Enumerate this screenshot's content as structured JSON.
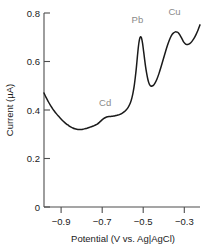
{
  "chart_data": {
    "type": "line",
    "title": "",
    "subtitle": "",
    "xlabel": "Potential (V vs. Ag|AgCl)",
    "ylabel": "Current (µA)",
    "xlim": [
      -0.97,
      -0.21
    ],
    "ylim": [
      0,
      0.8
    ],
    "grid": false,
    "legend": "none",
    "xticks": [
      -0.9,
      -0.7,
      -0.5,
      -0.3
    ],
    "xtick_labels": [
      "−0.9",
      "−0.7",
      "−0.5",
      "−0.3"
    ],
    "yticks": [
      0,
      0.2,
      0.4,
      0.6,
      0.8
    ],
    "ytick_labels": [
      "0",
      "0.2",
      "0.4",
      "0.6",
      "0.8"
    ],
    "series": [
      {
        "name": "stripping voltammogram",
        "color": "#1a1a1a",
        "x": [
          -0.97,
          -0.96,
          -0.95,
          -0.94,
          -0.93,
          -0.92,
          -0.91,
          -0.9,
          -0.89,
          -0.88,
          -0.87,
          -0.86,
          -0.85,
          -0.84,
          -0.83,
          -0.82,
          -0.81,
          -0.8,
          -0.79,
          -0.78,
          -0.77,
          -0.76,
          -0.75,
          -0.74,
          -0.73,
          -0.72,
          -0.71,
          -0.7,
          -0.69,
          -0.68,
          -0.67,
          -0.66,
          -0.65,
          -0.64,
          -0.63,
          -0.62,
          -0.61,
          -0.6,
          -0.59,
          -0.58,
          -0.57,
          -0.56,
          -0.55,
          -0.545,
          -0.54,
          -0.535,
          -0.53,
          -0.525,
          -0.52,
          -0.515,
          -0.51,
          -0.505,
          -0.5,
          -0.495,
          -0.49,
          -0.485,
          -0.48,
          -0.475,
          -0.47,
          -0.465,
          -0.46,
          -0.455,
          -0.45,
          -0.44,
          -0.43,
          -0.42,
          -0.41,
          -0.4,
          -0.39,
          -0.38,
          -0.37,
          -0.36,
          -0.35,
          -0.34,
          -0.33,
          -0.325,
          -0.32,
          -0.315,
          -0.31,
          -0.305,
          -0.3,
          -0.295,
          -0.29,
          -0.285,
          -0.28,
          -0.275,
          -0.27,
          -0.26,
          -0.25,
          -0.24,
          -0.23,
          -0.22,
          -0.21
        ],
        "y": [
          0.47,
          0.452,
          0.436,
          0.421,
          0.408,
          0.396,
          0.385,
          0.375,
          0.366,
          0.357,
          0.349,
          0.342,
          0.336,
          0.33,
          0.326,
          0.323,
          0.321,
          0.32,
          0.32,
          0.321,
          0.323,
          0.325,
          0.328,
          0.331,
          0.334,
          0.338,
          0.342,
          0.349,
          0.357,
          0.364,
          0.369,
          0.372,
          0.373,
          0.374,
          0.375,
          0.377,
          0.379,
          0.382,
          0.386,
          0.392,
          0.4,
          0.411,
          0.428,
          0.44,
          0.456,
          0.477,
          0.503,
          0.536,
          0.575,
          0.62,
          0.662,
          0.69,
          0.702,
          0.697,
          0.676,
          0.644,
          0.61,
          0.578,
          0.552,
          0.53,
          0.514,
          0.504,
          0.499,
          0.5,
          0.51,
          0.527,
          0.55,
          0.577,
          0.606,
          0.635,
          0.663,
          0.687,
          0.706,
          0.717,
          0.722,
          0.722,
          0.721,
          0.718,
          0.712,
          0.705,
          0.697,
          0.689,
          0.681,
          0.676,
          0.672,
          0.67,
          0.67,
          0.674,
          0.682,
          0.694,
          0.71,
          0.729,
          0.751
        ]
      }
    ],
    "annotations": [
      {
        "label": "Cd",
        "x": -0.672,
        "y": 0.415,
        "color": "#8a8a8a"
      },
      {
        "label": "Pb",
        "x": -0.515,
        "y": 0.76,
        "color": "#8a8a8a"
      },
      {
        "label": "Cu",
        "x": -0.334,
        "y": 0.79,
        "color": "#8a8a8a"
      }
    ],
    "peaks": [
      {
        "element": "Cd",
        "potential": -0.72,
        "current": 0.375,
        "shape": "shoulder"
      },
      {
        "element": "Pb",
        "potential": -0.5,
        "current": 0.702,
        "shape": "sharp peak"
      },
      {
        "element": "Cu",
        "potential": -0.33,
        "current": 0.722,
        "shape": "broad peak"
      }
    ]
  }
}
